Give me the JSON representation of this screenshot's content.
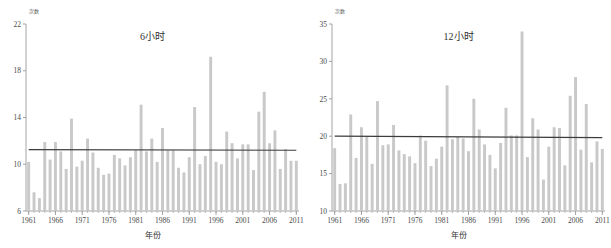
{
  "figure": {
    "background_color": "#ffffff",
    "bar_color": "#c9c9c9",
    "axis_color": "#9a9a9a",
    "trend_color": "#3c3c3c",
    "text_color": "#3a3a3a"
  },
  "charts": [
    {
      "id": "chart-6h",
      "title": "6小时",
      "xlabel": "年份",
      "ylabel_unit": "次数",
      "unit_text": "次数"
    },
    {
      "id": "chart-12h",
      "title": "12小时",
      "xlabel": "年份",
      "ylabel_unit": "次数",
      "unit_text": "次数"
    }
  ],
  "chart_data": [
    {
      "type": "bar",
      "title": "6小时",
      "xlabel": "年份",
      "ylabel": "次数",
      "ylim": [
        6,
        22
      ],
      "yticks": [
        6,
        10,
        14,
        18,
        22
      ],
      "xlim": [
        1960.5,
        2011.5
      ],
      "xticks": [
        1961,
        1966,
        1971,
        1976,
        1981,
        1986,
        1991,
        1996,
        2001,
        2006,
        2011
      ],
      "grid": false,
      "legend": "none",
      "series": [
        {
          "name": "6小时暴雨次数",
          "kind": "bar",
          "x": [
            1961,
            1962,
            1963,
            1964,
            1965,
            1966,
            1967,
            1968,
            1969,
            1970,
            1971,
            1972,
            1973,
            1974,
            1975,
            1976,
            1977,
            1978,
            1979,
            1980,
            1981,
            1982,
            1983,
            1984,
            1985,
            1986,
            1987,
            1988,
            1989,
            1990,
            1991,
            1992,
            1993,
            1994,
            1995,
            1996,
            1997,
            1998,
            1999,
            2000,
            2001,
            2002,
            2003,
            2004,
            2005,
            2006,
            2007,
            2008,
            2009,
            2010,
            2011
          ],
          "values": [
            10.2,
            7.6,
            7.1,
            11.9,
            10.4,
            11.9,
            11.1,
            9.6,
            13.9,
            9.8,
            10.3,
            12.2,
            11.0,
            9.7,
            9.1,
            9.2,
            10.8,
            10.5,
            9.9,
            10.6,
            11.2,
            15.1,
            11.1,
            12.2,
            10.2,
            13.1,
            11.2,
            11.2,
            9.7,
            9.3,
            10.6,
            14.9,
            10.0,
            10.7,
            19.2,
            10.2,
            10.0,
            12.8,
            11.8,
            10.5,
            11.7,
            11.7,
            9.5,
            14.5,
            16.2,
            11.8,
            12.9,
            9.6,
            11.3,
            10.3,
            10.3
          ]
        },
        {
          "name": "趋势线",
          "kind": "line",
          "x": [
            1961,
            2011
          ],
          "values": [
            11.25,
            11.2
          ]
        }
      ]
    },
    {
      "type": "bar",
      "title": "12小时",
      "xlabel": "年份",
      "ylabel": "次数",
      "ylim": [
        10,
        35
      ],
      "yticks": [
        10,
        15,
        20,
        25,
        30,
        35
      ],
      "xlim": [
        1960.5,
        2011.5
      ],
      "xticks": [
        1961,
        1966,
        1971,
        1976,
        1981,
        1986,
        1991,
        1996,
        2001,
        2006,
        2011
      ],
      "grid": false,
      "legend": "none",
      "series": [
        {
          "name": "12小时暴雨次数",
          "kind": "bar",
          "x": [
            1961,
            1962,
            1963,
            1964,
            1965,
            1966,
            1967,
            1968,
            1969,
            1970,
            1971,
            1972,
            1973,
            1974,
            1975,
            1976,
            1977,
            1978,
            1979,
            1980,
            1981,
            1982,
            1983,
            1984,
            1985,
            1986,
            1987,
            1988,
            1989,
            1990,
            1991,
            1992,
            1993,
            1994,
            1995,
            1996,
            1997,
            1998,
            1999,
            2000,
            2001,
            2002,
            2003,
            2004,
            2005,
            2006,
            2007,
            2008,
            2009,
            2010,
            2011
          ],
          "values": [
            18.4,
            13.6,
            13.7,
            22.9,
            17.1,
            21.2,
            19.9,
            16.3,
            24.7,
            18.8,
            18.9,
            21.5,
            18.1,
            17.6,
            17.3,
            16.4,
            20.1,
            19.4,
            16.0,
            17.0,
            18.6,
            26.8,
            19.6,
            19.9,
            19.7,
            18.0,
            25.0,
            20.9,
            18.9,
            17.5,
            15.7,
            19.1,
            23.8,
            20.1,
            20.1,
            34.0,
            17.2,
            22.4,
            20.9,
            14.2,
            18.6,
            21.2,
            21.1,
            16.1,
            25.4,
            27.9,
            18.2,
            24.3,
            16.5,
            19.3,
            18.3
          ]
        },
        {
          "name": "趋势线",
          "kind": "line",
          "x": [
            1961,
            2011
          ],
          "values": [
            20.0,
            19.8
          ]
        }
      ]
    }
  ]
}
